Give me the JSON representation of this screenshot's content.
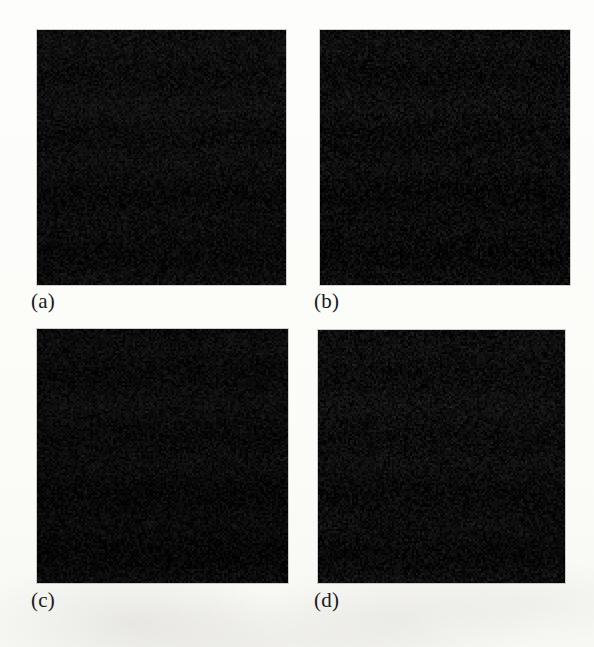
{
  "figure": {
    "kind": "scanned-paper-figure",
    "background_color": "#fdfdfb",
    "panel_count": 4,
    "layout": "2x2-grid",
    "panels": [
      {
        "id": "a",
        "label": "(a)",
        "fill_color": "#0a0a0a",
        "appearance": "uniform very dark noisy image",
        "mean_intensity": 12,
        "noise_amplitude": 18,
        "seed": 11,
        "border_color": "#78786f"
      },
      {
        "id": "b",
        "label": "(b)",
        "fill_color": "#090909",
        "appearance": "uniform very dark noisy image",
        "mean_intensity": 11,
        "noise_amplitude": 20,
        "seed": 23,
        "border_color": "#78786f"
      },
      {
        "id": "c",
        "label": "(c)",
        "fill_color": "#080808",
        "appearance": "uniform very dark noisy image",
        "mean_intensity": 10,
        "noise_amplitude": 17,
        "seed": 37,
        "border_color": "#78786f"
      },
      {
        "id": "d",
        "label": "(d)",
        "fill_color": "#0b0b0b",
        "appearance": "uniform very dark noisy image",
        "mean_intensity": 12,
        "noise_amplitude": 19,
        "seed": 53,
        "border_color": "#78786f"
      }
    ]
  },
  "chart_data": {
    "type": "heatmap",
    "title": "",
    "xlabel": "",
    "ylabel": "",
    "subplots": [
      {
        "label": "(a)",
        "row": 0,
        "col": 0,
        "values_mean": 12,
        "values_std": 6,
        "colormap": "gray",
        "clim": [
          0,
          255
        ]
      },
      {
        "label": "(b)",
        "row": 0,
        "col": 1,
        "values_mean": 11,
        "values_std": 6,
        "colormap": "gray",
        "clim": [
          0,
          255
        ]
      },
      {
        "label": "(c)",
        "row": 1,
        "col": 0,
        "values_mean": 10,
        "values_std": 6,
        "colormap": "gray",
        "clim": [
          0,
          255
        ]
      },
      {
        "label": "(d)",
        "row": 1,
        "col": 1,
        "values_mean": 12,
        "values_std": 6,
        "colormap": "gray",
        "clim": [
          0,
          255
        ]
      }
    ],
    "legend": "none",
    "grid": false
  }
}
